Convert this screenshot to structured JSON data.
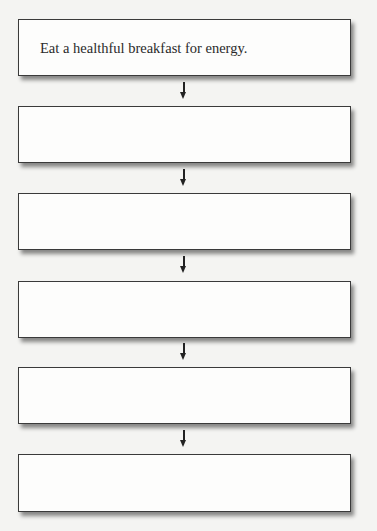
{
  "diagram": {
    "type": "vertical-flowchart",
    "steps": [
      {
        "label": "Eat a healthful breakfast for energy."
      },
      {
        "label": ""
      },
      {
        "label": ""
      },
      {
        "label": ""
      },
      {
        "label": ""
      },
      {
        "label": ""
      }
    ],
    "connector": "down-arrow"
  }
}
